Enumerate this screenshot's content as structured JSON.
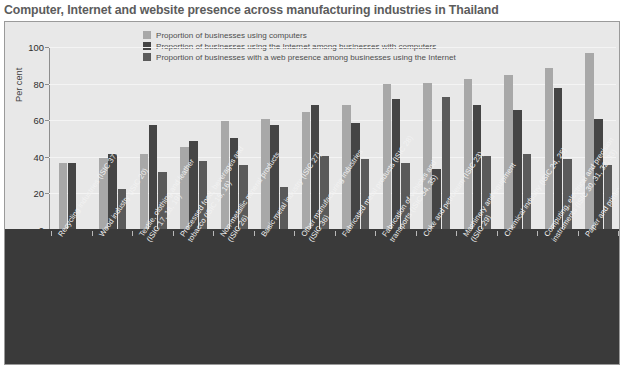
{
  "title": "Computer, Internet and website presence across manufacturing industries in Thailand",
  "axes": {
    "ylabel": "Per cent",
    "yticks": [
      "0",
      "20",
      "40",
      "60",
      "80",
      "100"
    ]
  },
  "legend": {
    "items": [
      {
        "label": "Proportion of businesses using computers",
        "color": "#a8a8a8",
        "icon": "legend-swatch"
      },
      {
        "label": "Proportion of businesses using the Internet among businesses with computers",
        "color": "#454545",
        "icon": "legend-swatch"
      },
      {
        "label": "Proportion of businesses with a web presence among businesses using the Internet",
        "color": "#5a5a5a",
        "icon": "legend-swatch"
      }
    ]
  },
  "chart_data": {
    "type": "bar",
    "title": "Computer, Internet and website presence across manufacturing industries in Thailand",
    "xlabel": "",
    "ylabel": "Per cent",
    "ylim": [
      0,
      100
    ],
    "ytick_step": 20,
    "grid": true,
    "legend_position": "top-center",
    "categories": [
      "Recycling industries (ISIC 37)",
      "Wood industry (ISIC 20)",
      "Textile, clothing and leather (ISIC 17, 18, 19)",
      "Processed food, beverages and tobacco (ISIC 15, 16)",
      "Non-metallic mineral products (ISIC 26)",
      "Basic metal industry (ISIC 27)",
      "Other manufacturing industries (ISIC 36)",
      "Fabricated metal products (ISIC 28)",
      "Fabrication of vehicles and transports (ISIC 34, 35)",
      "Coke and petroleum (ISIC 23)",
      "Machinery and equipment (ISIC 29)",
      "Chemical industry (ISIC 24, 25)",
      "Computing, electrical and precision instruments (ISIC 30, 31, 32, 33)",
      "Paper and printing (ISIC 21, 22)"
    ],
    "category_lines": [
      [
        "Recycling industries (ISIC 37)"
      ],
      [
        "Wood industry (ISIC 20)"
      ],
      [
        "Textile, clothing and leather",
        "(ISIC 17, 18, 19)"
      ],
      [
        "Processed food, beverages and",
        "tobacco (ISIC 15, 16)"
      ],
      [
        "Non-metallic mineral products",
        "(ISIC 26)"
      ],
      [
        "Basic metal industry (ISIC 27)"
      ],
      [
        "Other manufacturing industries",
        "(ISIC 36)"
      ],
      [
        "Fabricated metal products (ISIC 28)"
      ],
      [
        "Fabrication of vehicles and",
        "transports (ISIC 34, 35)"
      ],
      [
        "Coke and petroleum (ISIC 23)"
      ],
      [
        "Machinery and equipment",
        "(ISIC 29)"
      ],
      [
        "Chemical industry (ISIC 24, 25)"
      ],
      [
        "Computing, electrical and precision",
        "instruments (ISIC 30, 31, 32, 33)"
      ],
      [
        "Paper and printing (ISIC 21, 22)"
      ]
    ],
    "series": [
      {
        "name": "Proportion of businesses using computers",
        "color": "#a8a8a8",
        "values": [
          36,
          39,
          41,
          45,
          59,
          60,
          64,
          68,
          79,
          80,
          82,
          84,
          88,
          96
        ]
      },
      {
        "name": "Proportion of businesses using the Internet among businesses with computers",
        "color": "#454545",
        "values": [
          36,
          41,
          57,
          48,
          50,
          57,
          68,
          58,
          71,
          33,
          68,
          65,
          77,
          60
        ]
      },
      {
        "name": "Proportion of businesses with a web presence among businesses using the Internet",
        "color": "#5a5a5a",
        "values": [
          0,
          22,
          31,
          37,
          35,
          23,
          40,
          38,
          36,
          72,
          40,
          41,
          38,
          35
        ]
      }
    ]
  }
}
